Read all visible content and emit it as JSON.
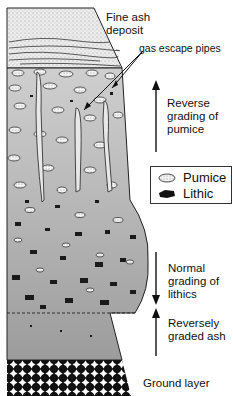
{
  "labels": {
    "fine_ash": "Fine ash\ndeposit",
    "gas_pipes": "gas escape pipes",
    "reverse_pumice": "Reverse\ngrading of\npumice",
    "normal_lithics": "Normal\ngrading of\nlithics",
    "reversely_ash": "Reversely\ngraded ash",
    "ground_layer": "Ground layer"
  },
  "legend": {
    "items": [
      {
        "label": "Pumice",
        "icon": "pumice-clast-icon"
      },
      {
        "label": "Lithic",
        "icon": "lithic-clast-icon"
      }
    ]
  },
  "colors": {
    "ash_fill": "#e6e6e6",
    "body_fill": "#b4b4b4",
    "lower_fill": "#a8a8a8",
    "outline": "#222222"
  }
}
